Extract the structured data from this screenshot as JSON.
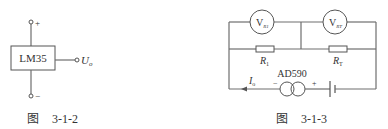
{
  "figure_left": {
    "chip_label": "LM35",
    "plus_terminal": "+",
    "minus_terminal": "−",
    "output_label": "U",
    "output_subscript": "o",
    "caption_prefix": "图",
    "caption_number": "3-1-2"
  },
  "figure_right": {
    "voltmeter_1": {
      "main": "V",
      "sub": "R1"
    },
    "voltmeter_2": {
      "main": "V",
      "sub": "RT"
    },
    "resistor_1": {
      "main": "R",
      "sub": "1"
    },
    "resistor_2": {
      "main": "R",
      "sub": "T"
    },
    "current_label": {
      "main": "I",
      "sub": "o"
    },
    "sensor_label": "AD590",
    "sensor_minus": "−",
    "sensor_plus": "+",
    "caption_prefix": "图",
    "caption_number": "3-1-3"
  },
  "colors": {
    "line": "#6e6e6e",
    "text": "#333333",
    "background": "#ffffff"
  }
}
